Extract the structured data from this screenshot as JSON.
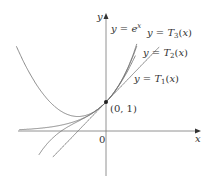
{
  "figure": {
    "axes": {
      "x_label": "x",
      "y_label": "y",
      "origin_label": "0"
    },
    "point": {
      "label": "(0, 1)"
    },
    "curves": [
      {
        "id": "exp",
        "label": "y = e^x",
        "expr": "e^x"
      },
      {
        "id": "T3",
        "label": "y = T3(x)",
        "expr": "1 + x + x^2/2 + x^3/6"
      },
      {
        "id": "T2",
        "label": "y = T2(x)",
        "expr": "1 + x + x^2/2"
      },
      {
        "id": "T1",
        "label": "y = T1(x)",
        "expr": "1 + x"
      }
    ],
    "colors": {
      "curve": "#6e6e6e",
      "axis": "#555555",
      "text": "#333333"
    }
  }
}
